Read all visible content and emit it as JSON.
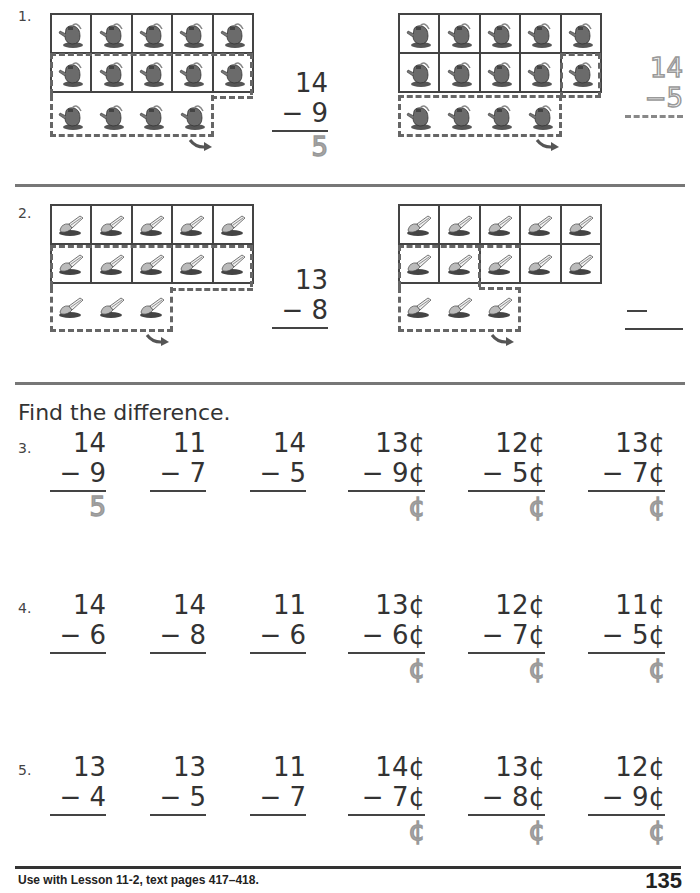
{
  "problems": {
    "p1": {
      "label": "1.",
      "object_icon": "watering-can-icon",
      "total": 14,
      "left": {
        "top": "14",
        "sub": "− 9",
        "answer": "5"
      },
      "right": {
        "top": "14",
        "sub": "−5",
        "answer": ""
      }
    },
    "p2": {
      "label": "2.",
      "object_icon": "trowel-icon",
      "total": 13,
      "left": {
        "top": "13",
        "sub": "− 8",
        "answer": ""
      },
      "right": {
        "top": "",
        "sub": "—",
        "answer": ""
      }
    }
  },
  "instruction": "Find the difference.",
  "rows": [
    {
      "label": "3.",
      "items": [
        {
          "top": "14",
          "sub": "− 9",
          "answer": "5"
        },
        {
          "top": "11",
          "sub": "− 7",
          "answer": ""
        },
        {
          "top": "14",
          "sub": "− 5",
          "answer": ""
        },
        {
          "top": "13¢",
          "sub": "− 9¢",
          "answer": "¢"
        },
        {
          "top": "12¢",
          "sub": "− 5¢",
          "answer": "¢"
        },
        {
          "top": "13¢",
          "sub": "− 7¢",
          "answer": "¢"
        }
      ]
    },
    {
      "label": "4.",
      "items": [
        {
          "top": "14",
          "sub": "− 6",
          "answer": ""
        },
        {
          "top": "14",
          "sub": "− 8",
          "answer": ""
        },
        {
          "top": "11",
          "sub": "− 6",
          "answer": ""
        },
        {
          "top": "13¢",
          "sub": "− 6¢",
          "answer": "¢"
        },
        {
          "top": "12¢",
          "sub": "− 7¢",
          "answer": "¢"
        },
        {
          "top": "11¢",
          "sub": "− 5¢",
          "answer": "¢"
        }
      ]
    },
    {
      "label": "5.",
      "items": [
        {
          "top": "13",
          "sub": "− 4",
          "answer": ""
        },
        {
          "top": "13",
          "sub": "− 5",
          "answer": ""
        },
        {
          "top": "11",
          "sub": "− 7",
          "answer": ""
        },
        {
          "top": "14¢",
          "sub": "− 7¢",
          "answer": "¢"
        },
        {
          "top": "13¢",
          "sub": "− 8¢",
          "answer": "¢"
        },
        {
          "top": "12¢",
          "sub": "− 9¢",
          "answer": "¢"
        }
      ]
    }
  ],
  "footer": {
    "text": "Use with Lesson 11-2, text pages 417–418.",
    "page_number": "135"
  }
}
